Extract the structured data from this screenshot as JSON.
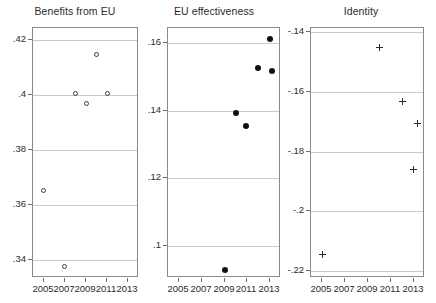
{
  "figure": {
    "width": 436,
    "height": 303,
    "background": "#ffffff",
    "grid_color": "#c9c9c9",
    "frame_color": "#8a8a8a"
  },
  "chart_data": [
    {
      "type": "scatter",
      "title": "Benefits from EU",
      "xlabel": "",
      "ylabel": "",
      "xlim": [
        2004,
        2014
      ],
      "ylim": [
        0.3335,
        0.4245
      ],
      "grid": true,
      "legend": "none",
      "marker": "open-circle",
      "xticks": [
        2005,
        2007,
        2009,
        2011,
        2013
      ],
      "xtick_labels": [
        "2005",
        "2007",
        "2009",
        "2011",
        "2013"
      ],
      "yticks": [
        0.34,
        0.36,
        0.38,
        0.4,
        0.42
      ],
      "ytick_labels": [
        ".34",
        ".36",
        ".38",
        ".4",
        ".42"
      ],
      "points": [
        {
          "x": 2005.0,
          "y": 0.3652
        },
        {
          "x": 2007.0,
          "y": 0.3376
        },
        {
          "x": 2008.0,
          "y": 0.4008
        },
        {
          "x": 2009.0,
          "y": 0.3972
        },
        {
          "x": 2010.0,
          "y": 0.4148
        },
        {
          "x": 2011.0,
          "y": 0.4005
        }
      ]
    },
    {
      "type": "scatter",
      "title": "EU effectiveness",
      "xlabel": "",
      "ylabel": "",
      "xlim": [
        2004,
        2014
      ],
      "ylim": [
        0.0905,
        0.1645
      ],
      "grid": true,
      "legend": "none",
      "marker": "filled-circle",
      "xticks": [
        2005,
        2007,
        2009,
        2011,
        2013
      ],
      "xtick_labels": [
        "2005",
        "2007",
        "2009",
        "2011",
        "2013"
      ],
      "yticks": [
        0.1,
        0.12,
        0.14,
        0.16
      ],
      "ytick_labels": [
        ".1",
        ".12",
        ".14",
        ".16"
      ],
      "points": [
        {
          "x": 2009.0,
          "y": 0.093
        },
        {
          "x": 2010.0,
          "y": 0.1392
        },
        {
          "x": 2010.9,
          "y": 0.1355
        },
        {
          "x": 2012.0,
          "y": 0.1528
        },
        {
          "x": 2013.0,
          "y": 0.1612
        },
        {
          "x": 2013.2,
          "y": 0.1518
        }
      ]
    },
    {
      "type": "scatter",
      "title": "Identity",
      "xlabel": "",
      "ylabel": "",
      "xlim": [
        2004,
        2014
      ],
      "ylim": [
        -0.2225,
        -0.1385
      ],
      "grid": true,
      "legend": "none",
      "marker": "plus",
      "xticks": [
        2005,
        2007,
        2009,
        2011,
        2013
      ],
      "xtick_labels": [
        "2005",
        "2007",
        "2009",
        "2011",
        "2013"
      ],
      "yticks": [
        -0.22,
        -0.2,
        -0.18,
        -0.16,
        -0.14
      ],
      "ytick_labels": [
        "-.22",
        "-.2",
        "-.18",
        "-.16",
        "-.14"
      ],
      "points": [
        {
          "x": 2005.0,
          "y": -0.2145
        },
        {
          "x": 2010.0,
          "y": -0.1452
        },
        {
          "x": 2012.0,
          "y": -0.1633
        },
        {
          "x": 2013.0,
          "y": -0.1862
        },
        {
          "x": 2013.3,
          "y": -0.1707
        }
      ]
    }
  ],
  "panels_layout": [
    {
      "left": 8,
      "width": 134,
      "plot_left": 32,
      "plot_width": 106
    },
    {
      "left": 145,
      "width": 138,
      "plot_left": 167,
      "plot_width": 113
    },
    {
      "left": 288,
      "width": 146,
      "plot_left": 310,
      "plot_width": 114
    }
  ],
  "plot_top": 27,
  "plot_bottom": 277
}
